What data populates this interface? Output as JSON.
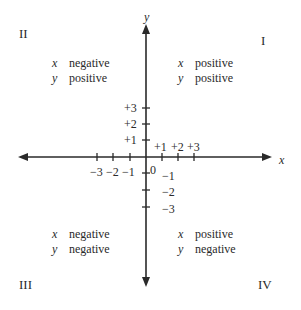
{
  "axes": {
    "x_label": "x",
    "y_label": "y",
    "x_ticks_positive": [
      "+1",
      "+2",
      "+3"
    ],
    "x_ticks_negative": [
      "−3",
      "−2",
      "−1"
    ],
    "y_ticks_positive": [
      "+3",
      "+2",
      "+1"
    ],
    "y_ticks_negative": [
      "−1",
      "−2",
      "−3"
    ],
    "origin": "0"
  },
  "quadrants": [
    {
      "numeral": "I",
      "x_var": "x",
      "x_sign": "positive",
      "y_var": "y",
      "y_sign": "positive"
    },
    {
      "numeral": "II",
      "x_var": "x",
      "x_sign": "negative",
      "y_var": "y",
      "y_sign": "positive"
    },
    {
      "numeral": "III",
      "x_var": "x",
      "x_sign": "negative",
      "y_var": "y",
      "y_sign": "negative"
    },
    {
      "numeral": "IV",
      "x_var": "x",
      "x_sign": "positive",
      "y_var": "y",
      "y_sign": "negative"
    }
  ],
  "colors": {
    "ink": "#2a2a2a",
    "background": "#ffffff"
  }
}
